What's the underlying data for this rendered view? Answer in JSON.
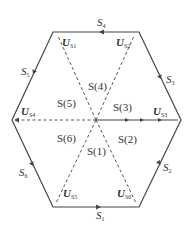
{
  "diagram": {
    "type": "space-vector hexagon",
    "colors": {
      "line": "#444444",
      "background": "#ffffff",
      "text": "#333333"
    },
    "vectors": [
      {
        "name": "U",
        "sub": "S1"
      },
      {
        "name": "U",
        "sub": "S2"
      },
      {
        "name": "U",
        "sub": "S3"
      },
      {
        "name": "U",
        "sub": "S4"
      },
      {
        "name": "U",
        "sub": "S5"
      },
      {
        "name": "U",
        "sub": "S6"
      }
    ],
    "edges": [
      {
        "name": "S",
        "sub": "4"
      },
      {
        "name": "S",
        "sub": "5"
      },
      {
        "name": "S",
        "sub": "3"
      },
      {
        "name": "S",
        "sub": "6"
      },
      {
        "name": "S",
        "sub": "2"
      },
      {
        "name": "S",
        "sub": "1"
      }
    ],
    "sectors": [
      "S(4)",
      "S(5)",
      "S(3)",
      "S(6)",
      "S(2)",
      "S(1)"
    ]
  }
}
